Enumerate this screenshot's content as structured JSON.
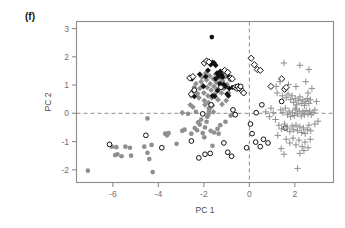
{
  "figure": {
    "panel_label": "(f)",
    "background": "#ffffff"
  },
  "chart_data": {
    "type": "scatter",
    "title": "",
    "panel": "(f)",
    "xlabel": "PC 1",
    "ylabel": "PC 2",
    "xlim": [
      -7.6,
      3.7
    ],
    "ylim": [
      -2.45,
      3.25
    ],
    "xticks": [
      -6,
      -4,
      -2,
      0,
      2
    ],
    "xticklabels": [
      "-6",
      "-4",
      "-2",
      "0",
      "2"
    ],
    "yticks": [
      -2,
      -1,
      0,
      1,
      2,
      3
    ],
    "yticklabels": [
      "-2",
      "-1",
      "0",
      "1",
      "2",
      "3"
    ],
    "grid": false,
    "legend": "none",
    "reference_lines": [
      {
        "axis": "x",
        "value": 0,
        "style": "dashed",
        "color": "#8d8d8d"
      },
      {
        "axis": "y",
        "value": 0,
        "style": "dashed",
        "color": "#8d8d8d"
      }
    ],
    "colors": {
      "gray_marker": "#8f8f8f",
      "black_marker": "#111111",
      "axis": "#8d8d8d",
      "text": "#4a4a4a"
    },
    "series": [
      {
        "name": "gray filled circle",
        "marker": "filled-circle",
        "color": "#8f8f8f",
        "points": [
          [
            -7.1,
            -2.03
          ],
          [
            -6.05,
            -1.18
          ],
          [
            -5.85,
            -1.2
          ],
          [
            -5.8,
            -1.45
          ],
          [
            -5.62,
            -1.52
          ],
          [
            -5.45,
            -1.18
          ],
          [
            -5.25,
            -1.22
          ],
          [
            -5.2,
            -1.5
          ],
          [
            -4.62,
            -1.18
          ],
          [
            -4.48,
            -1.4
          ],
          [
            -4.4,
            -1.62
          ],
          [
            -4.25,
            -2.08
          ],
          [
            -4.3,
            -1.12
          ],
          [
            -3.7,
            -0.72
          ],
          [
            -3.62,
            -0.78
          ],
          [
            -3.55,
            -0.7
          ],
          [
            -3.2,
            -1.08
          ],
          [
            -2.95,
            -0.62
          ],
          [
            -2.85,
            -0.58
          ],
          [
            -2.55,
            -0.72
          ],
          [
            -2.4,
            -0.52
          ],
          [
            -2.3,
            -0.6
          ],
          [
            -2.25,
            -0.32
          ],
          [
            -2.18,
            -0.4
          ],
          [
            -2.12,
            -0.22
          ],
          [
            -2.05,
            -0.7
          ],
          [
            -1.98,
            -0.85
          ],
          [
            -1.95,
            -0.5
          ],
          [
            -1.88,
            -0.3
          ],
          [
            -1.85,
            -0.12
          ],
          [
            -1.8,
            -0.05
          ],
          [
            -1.78,
            0.08
          ],
          [
            -1.72,
            0.2
          ],
          [
            -1.7,
            -0.62
          ],
          [
            -1.62,
            -1.15
          ],
          [
            -1.55,
            -0.68
          ],
          [
            -1.4,
            -0.55
          ],
          [
            -1.35,
            -0.72
          ],
          [
            -1.28,
            -0.42
          ],
          [
            -1.05,
            -0.3
          ],
          [
            -0.82,
            -0.08
          ],
          [
            -4.48,
            -0.18
          ],
          [
            -2.7,
            -0.02
          ],
          [
            -2.35,
            0.05
          ],
          [
            -5.9,
            -1.48
          ]
        ]
      },
      {
        "name": "gray filled diamond",
        "marker": "filled-diamond",
        "color": "#8f8f8f",
        "points": [
          [
            -2.55,
            0.62
          ],
          [
            -2.5,
            0.78
          ],
          [
            -2.42,
            0.92
          ],
          [
            -2.35,
            1.05
          ],
          [
            -2.28,
            0.7
          ],
          [
            -2.22,
            0.55
          ],
          [
            -2.18,
            0.88
          ],
          [
            -2.12,
            1.12
          ],
          [
            -2.08,
            1.28
          ],
          [
            -2.05,
            0.98
          ],
          [
            -2.0,
            0.72
          ],
          [
            -1.98,
            0.45
          ],
          [
            -1.95,
            0.3
          ],
          [
            -1.92,
            1.42
          ],
          [
            -1.88,
            1.18
          ],
          [
            -1.85,
            0.92
          ],
          [
            -1.82,
            0.62
          ],
          [
            -1.8,
            0.38
          ],
          [
            -1.78,
            0.18
          ],
          [
            -1.75,
            1.32
          ],
          [
            -1.72,
            1.05
          ],
          [
            -1.68,
            0.82
          ],
          [
            -1.65,
            0.55
          ],
          [
            -1.62,
            0.28
          ],
          [
            -1.58,
            1.22
          ],
          [
            -1.55,
            0.95
          ],
          [
            -1.52,
            0.68
          ],
          [
            -1.48,
            1.38
          ],
          [
            -1.45,
            1.1
          ],
          [
            -1.42,
            0.85
          ],
          [
            -1.38,
            0.48
          ],
          [
            -1.32,
            1.25
          ],
          [
            -1.28,
            1.0
          ],
          [
            -1.22,
            0.72
          ],
          [
            -1.18,
            1.15
          ],
          [
            -1.12,
            0.88
          ],
          [
            -1.05,
            1.3
          ],
          [
            -0.98,
            1.02
          ],
          [
            -0.92,
            0.72
          ],
          [
            -0.85,
            1.18
          ],
          [
            -2.6,
            0.3
          ],
          [
            -2.48,
            0.22
          ],
          [
            -2.95,
            0.02
          ],
          [
            -1.2,
            0.32
          ],
          [
            -1.58,
            0.05
          ],
          [
            -1.02,
            0.45
          ]
        ]
      },
      {
        "name": "black filled diamond",
        "marker": "filled-diamond",
        "color": "#111111",
        "points": [
          [
            -2.52,
            1.22
          ],
          [
            -2.18,
            1.38
          ],
          [
            -2.02,
            0.95
          ],
          [
            -1.82,
            1.52
          ],
          [
            -1.7,
            1.72
          ],
          [
            -1.62,
            1.8
          ],
          [
            -1.55,
            1.78
          ],
          [
            -1.48,
            1.7
          ],
          [
            -1.42,
            1.42
          ],
          [
            -1.35,
            1.32
          ],
          [
            -1.28,
            1.48
          ],
          [
            -1.22,
            1.38
          ],
          [
            -1.12,
            1.02
          ],
          [
            -1.05,
            0.95
          ],
          [
            -0.98,
            0.68
          ],
          [
            -0.92,
            0.62
          ],
          [
            -1.62,
            0.62
          ],
          [
            -1.52,
            0.6
          ],
          [
            -2.42,
            0.6
          ],
          [
            -1.4,
            0.8
          ],
          [
            -0.88,
            0.88
          ]
        ]
      },
      {
        "name": "black filled circle",
        "marker": "filled-circle",
        "color": "#111111",
        "points": [
          [
            -1.65,
            2.7
          ],
          [
            -1.48,
            1.22
          ],
          [
            -1.18,
            1.28
          ],
          [
            -0.9,
            1.3
          ],
          [
            -1.3,
            1.05
          ],
          [
            -0.72,
            0.92
          ],
          [
            -1.92,
            1.3
          ]
        ]
      },
      {
        "name": "open diamond black",
        "marker": "open-diamond",
        "color": "#111111",
        "points": [
          [
            -2.62,
            1.25
          ],
          [
            -2.48,
            1.3
          ],
          [
            -1.98,
            1.78
          ],
          [
            -1.88,
            1.85
          ],
          [
            -1.78,
            1.82
          ],
          [
            -1.08,
            1.52
          ],
          [
            -0.95,
            1.45
          ],
          [
            -0.82,
            1.25
          ],
          [
            -0.75,
            1.22
          ],
          [
            -0.62,
            0.92
          ],
          [
            -0.55,
            0.88
          ],
          [
            -0.48,
            0.95
          ],
          [
            -0.42,
            0.88
          ],
          [
            -0.35,
            0.82
          ],
          [
            0.08,
            1.95
          ],
          [
            0.22,
            1.72
          ],
          [
            0.35,
            1.55
          ],
          [
            0.48,
            1.52
          ],
          [
            1.42,
            1.22
          ],
          [
            1.55,
            0.85
          ],
          [
            1.62,
            0.92
          ],
          [
            0.95,
            0.95
          ],
          [
            -0.25,
            0.72
          ],
          [
            -2.55,
            0.68
          ]
        ]
      },
      {
        "name": "open circle black",
        "marker": "open-circle",
        "color": "#111111",
        "points": [
          [
            -6.15,
            -1.1
          ],
          [
            -4.55,
            -0.78
          ],
          [
            -3.85,
            -1.22
          ],
          [
            -2.55,
            -0.98
          ],
          [
            -2.22,
            -1.58
          ],
          [
            -1.95,
            -1.45
          ],
          [
            -1.72,
            -1.42
          ],
          [
            -1.12,
            -1.05
          ],
          [
            -0.95,
            -1.38
          ],
          [
            -0.78,
            -1.52
          ],
          [
            -0.62,
            -0.05
          ],
          [
            -2.05,
            -0.02
          ],
          [
            -2.42,
            0.82
          ],
          [
            -1.25,
            0.92
          ],
          [
            -0.52,
            0.95
          ],
          [
            -0.45,
            0.88
          ],
          [
            -0.38,
            0.95
          ],
          [
            0.05,
            -0.38
          ],
          [
            0.12,
            -0.72
          ],
          [
            0.28,
            -1.02
          ],
          [
            0.48,
            -1.18
          ],
          [
            0.62,
            -0.92
          ],
          [
            0.82,
            -1.05
          ],
          [
            0.55,
            0.3
          ],
          [
            1.42,
            0.42
          ],
          [
            1.58,
            -0.52
          ],
          [
            -0.12,
            -1.22
          ],
          [
            0.3,
            0.02
          ],
          [
            -1.68,
            0.3
          ],
          [
            -0.72,
            0.12
          ]
        ]
      },
      {
        "name": "gray plus",
        "marker": "plus",
        "color": "#8f8f8f",
        "points": [
          [
            1.52,
            1.78
          ],
          [
            2.22,
            1.7
          ],
          [
            2.62,
            1.55
          ],
          [
            1.22,
            0.72
          ],
          [
            1.45,
            0.62
          ],
          [
            1.62,
            0.55
          ],
          [
            1.7,
            0.68
          ],
          [
            1.82,
            0.48
          ],
          [
            1.88,
            0.62
          ],
          [
            1.95,
            0.38
          ],
          [
            2.02,
            0.52
          ],
          [
            2.08,
            0.3
          ],
          [
            2.15,
            0.45
          ],
          [
            2.22,
            0.58
          ],
          [
            2.28,
            0.35
          ],
          [
            2.35,
            0.48
          ],
          [
            2.42,
            0.28
          ],
          [
            2.48,
            0.42
          ],
          [
            2.55,
            0.52
          ],
          [
            2.62,
            0.35
          ],
          [
            2.68,
            0.48
          ],
          [
            1.38,
            0.12
          ],
          [
            1.48,
            0.02
          ],
          [
            1.58,
            0.18
          ],
          [
            1.68,
            -0.05
          ],
          [
            1.75,
            0.08
          ],
          [
            1.82,
            -0.12
          ],
          [
            1.9,
            0.02
          ],
          [
            1.98,
            -0.08
          ],
          [
            2.05,
            0.12
          ],
          [
            2.12,
            -0.02
          ],
          [
            2.2,
            0.08
          ],
          [
            2.28,
            -0.1
          ],
          [
            2.35,
            0.05
          ],
          [
            2.42,
            -0.05
          ],
          [
            2.5,
            0.1
          ],
          [
            2.58,
            -0.02
          ],
          [
            2.65,
            0.08
          ],
          [
            2.72,
            -0.05
          ],
          [
            2.8,
            0.02
          ],
          [
            2.88,
            0.12
          ],
          [
            1.3,
            -0.42
          ],
          [
            1.42,
            -0.55
          ],
          [
            1.55,
            -0.38
          ],
          [
            1.68,
            -0.52
          ],
          [
            1.78,
            -0.65
          ],
          [
            1.88,
            -0.45
          ],
          [
            1.95,
            -0.58
          ],
          [
            2.05,
            -0.42
          ],
          [
            2.12,
            -0.62
          ],
          [
            2.22,
            -0.48
          ],
          [
            2.3,
            -0.68
          ],
          [
            2.38,
            -0.52
          ],
          [
            2.45,
            -0.72
          ],
          [
            2.55,
            -0.58
          ],
          [
            2.62,
            -0.42
          ],
          [
            2.7,
            -0.62
          ],
          [
            1.62,
            -0.92
          ],
          [
            1.78,
            -1.05
          ],
          [
            1.92,
            -0.88
          ],
          [
            2.05,
            -1.12
          ],
          [
            2.18,
            -0.95
          ],
          [
            2.32,
            -1.18
          ],
          [
            2.45,
            -1.02
          ],
          [
            2.58,
            -1.22
          ],
          [
            2.68,
            -0.92
          ],
          [
            2.22,
            -1.42
          ],
          [
            2.4,
            -1.32
          ],
          [
            1.52,
            -1.45
          ],
          [
            2.12,
            -1.95
          ],
          [
            2.88,
            -0.38
          ],
          [
            3.02,
            -0.28
          ],
          [
            1.05,
            0.02
          ],
          [
            0.88,
            -0.12
          ],
          [
            1.15,
            -0.22
          ],
          [
            0.95,
            0.18
          ],
          [
            1.18,
            0.95
          ],
          [
            1.72,
            1.02
          ],
          [
            2.48,
            1.12
          ],
          [
            2.75,
            0.88
          ],
          [
            1.35,
            1.12
          ],
          [
            2.05,
            0.95
          ],
          [
            2.58,
            0.72
          ],
          [
            0.72,
            0.05
          ],
          [
            2.95,
            0.42
          ],
          [
            1.25,
            -0.78
          ],
          [
            1.4,
            -1.25
          ],
          [
            2.02,
            0.18
          ]
        ]
      }
    ]
  }
}
